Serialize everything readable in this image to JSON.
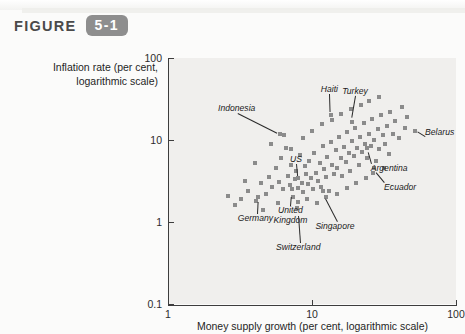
{
  "header": {
    "figure_word": "FIGURE",
    "figure_number": "5-1"
  },
  "chart_data": {
    "type": "scatter",
    "title": "",
    "xlabel": "Money supply growth (per cent, logarithmic scale)",
    "ylabel": "Inflation rate (per cent, logarithmic scale)",
    "ylabel_line1": "Inflation rate (per cent,",
    "ylabel_line2": "logarithmic scale)",
    "xscale": "log",
    "yscale": "log",
    "xlim": [
      1,
      100
    ],
    "ylim": [
      0.1,
      100
    ],
    "xticks": [
      "1",
      "10",
      "100"
    ],
    "yticks": [
      "100",
      "10",
      "1",
      "0.1"
    ],
    "grid": false,
    "legend": "none",
    "marker": "square",
    "marker_color": "#8b8b8b",
    "annotations": [
      {
        "label": "Indonesia",
        "x": 6.0,
        "y": 12.0
      },
      {
        "label": "Haiti",
        "x": 13.5,
        "y": 20.0
      },
      {
        "label": "Turkey",
        "x": 19.0,
        "y": 17.0
      },
      {
        "label": "Belarus",
        "x": 52.0,
        "y": 13.0
      },
      {
        "label": "Argentina",
        "x": 24.0,
        "y": 7.6
      },
      {
        "label": "Ecuador",
        "x": 27.0,
        "y": 4.2
      },
      {
        "label": "US",
        "x": 8.0,
        "y": 3.3
      },
      {
        "label": "United Kingdom",
        "x": 7.2,
        "y": 2.2
      },
      {
        "label": "Singapore",
        "x": 12.0,
        "y": 2.1
      },
      {
        "label": "Germany",
        "x": 4.2,
        "y": 1.9
      },
      {
        "label": "Switzerland",
        "x": 8.0,
        "y": 1.3
      }
    ],
    "points": [
      {
        "x": 3.2,
        "y": 1.9
      },
      {
        "x": 3.6,
        "y": 2.4
      },
      {
        "x": 4.1,
        "y": 1.8
      },
      {
        "x": 4.4,
        "y": 3.0
      },
      {
        "x": 4.8,
        "y": 2.2
      },
      {
        "x": 5.0,
        "y": 3.5
      },
      {
        "x": 5.3,
        "y": 2.7
      },
      {
        "x": 5.6,
        "y": 4.5
      },
      {
        "x": 5.9,
        "y": 3.1
      },
      {
        "x": 6.1,
        "y": 6.0
      },
      {
        "x": 6.3,
        "y": 2.5
      },
      {
        "x": 6.6,
        "y": 8.0
      },
      {
        "x": 6.8,
        "y": 3.6
      },
      {
        "x": 7.0,
        "y": 2.8
      },
      {
        "x": 7.2,
        "y": 5.0
      },
      {
        "x": 7.4,
        "y": 2.0
      },
      {
        "x": 7.6,
        "y": 3.3
      },
      {
        "x": 7.8,
        "y": 4.2
      },
      {
        "x": 8.0,
        "y": 2.6
      },
      {
        "x": 8.2,
        "y": 6.5
      },
      {
        "x": 8.5,
        "y": 3.0
      },
      {
        "x": 8.7,
        "y": 2.3
      },
      {
        "x": 8.9,
        "y": 4.8
      },
      {
        "x": 9.1,
        "y": 3.8
      },
      {
        "x": 9.4,
        "y": 2.9
      },
      {
        "x": 9.6,
        "y": 5.5
      },
      {
        "x": 9.9,
        "y": 3.4
      },
      {
        "x": 10.2,
        "y": 2.5
      },
      {
        "x": 10.4,
        "y": 7.0
      },
      {
        "x": 10.7,
        "y": 4.0
      },
      {
        "x": 11.0,
        "y": 3.2
      },
      {
        "x": 11.3,
        "y": 5.2
      },
      {
        "x": 11.6,
        "y": 2.7
      },
      {
        "x": 11.9,
        "y": 8.5
      },
      {
        "x": 12.2,
        "y": 4.4
      },
      {
        "x": 12.5,
        "y": 3.5
      },
      {
        "x": 12.8,
        "y": 6.2
      },
      {
        "x": 13.1,
        "y": 2.4
      },
      {
        "x": 13.5,
        "y": 9.5
      },
      {
        "x": 13.8,
        "y": 5.0
      },
      {
        "x": 14.2,
        "y": 3.8
      },
      {
        "x": 14.6,
        "y": 7.5
      },
      {
        "x": 15.0,
        "y": 4.6
      },
      {
        "x": 15.4,
        "y": 11.0
      },
      {
        "x": 15.8,
        "y": 6.0
      },
      {
        "x": 16.2,
        "y": 3.6
      },
      {
        "x": 16.7,
        "y": 8.2
      },
      {
        "x": 17.1,
        "y": 5.4
      },
      {
        "x": 17.6,
        "y": 12.5
      },
      {
        "x": 18.0,
        "y": 7.0
      },
      {
        "x": 18.5,
        "y": 4.2
      },
      {
        "x": 19.0,
        "y": 9.8
      },
      {
        "x": 19.5,
        "y": 6.4
      },
      {
        "x": 20.0,
        "y": 14.0
      },
      {
        "x": 20.6,
        "y": 8.0
      },
      {
        "x": 21.1,
        "y": 5.0
      },
      {
        "x": 21.7,
        "y": 11.0
      },
      {
        "x": 22.3,
        "y": 7.2
      },
      {
        "x": 22.9,
        "y": 16.0
      },
      {
        "x": 23.5,
        "y": 9.0
      },
      {
        "x": 24.2,
        "y": 6.0
      },
      {
        "x": 24.8,
        "y": 12.0
      },
      {
        "x": 25.5,
        "y": 8.4
      },
      {
        "x": 26.2,
        "y": 18.0
      },
      {
        "x": 27.0,
        "y": 10.0
      },
      {
        "x": 27.8,
        "y": 5.5
      },
      {
        "x": 28.6,
        "y": 13.5
      },
      {
        "x": 29.4,
        "y": 7.8
      },
      {
        "x": 30.2,
        "y": 20.0
      },
      {
        "x": 31.0,
        "y": 11.5
      },
      {
        "x": 32.0,
        "y": 9.0
      },
      {
        "x": 33.0,
        "y": 15.0
      },
      {
        "x": 34.0,
        "y": 6.8
      },
      {
        "x": 35.0,
        "y": 22.0
      },
      {
        "x": 36.5,
        "y": 12.0
      },
      {
        "x": 38.0,
        "y": 17.0
      },
      {
        "x": 40.0,
        "y": 10.5
      },
      {
        "x": 42.0,
        "y": 25.0
      },
      {
        "x": 44.0,
        "y": 14.0
      },
      {
        "x": 46.0,
        "y": 19.0
      },
      {
        "x": 2.6,
        "y": 2.1
      },
      {
        "x": 2.9,
        "y": 1.6
      },
      {
        "x": 3.4,
        "y": 3.2
      },
      {
        "x": 4.0,
        "y": 5.2
      },
      {
        "x": 4.6,
        "y": 1.4
      },
      {
        "x": 5.2,
        "y": 9.0
      },
      {
        "x": 5.8,
        "y": 1.7
      },
      {
        "x": 6.4,
        "y": 11.5
      },
      {
        "x": 7.1,
        "y": 7.8
      },
      {
        "x": 7.9,
        "y": 1.5
      },
      {
        "x": 8.6,
        "y": 10.5
      },
      {
        "x": 9.2,
        "y": 1.9
      },
      {
        "x": 10.0,
        "y": 13.0
      },
      {
        "x": 10.9,
        "y": 1.7
      },
      {
        "x": 11.8,
        "y": 15.5
      },
      {
        "x": 12.6,
        "y": 2.0
      },
      {
        "x": 13.7,
        "y": 17.5
      },
      {
        "x": 14.9,
        "y": 2.2
      },
      {
        "x": 16.0,
        "y": 21.0
      },
      {
        "x": 17.4,
        "y": 2.6
      },
      {
        "x": 18.8,
        "y": 24.0
      },
      {
        "x": 20.3,
        "y": 3.0
      },
      {
        "x": 21.9,
        "y": 27.0
      },
      {
        "x": 23.7,
        "y": 3.4
      },
      {
        "x": 25.0,
        "y": 30.0
      },
      {
        "x": 26.5,
        "y": 4.0
      },
      {
        "x": 29.0,
        "y": 33.0
      },
      {
        "x": 31.5,
        "y": 4.6
      },
      {
        "x": 52.0,
        "y": 13.0
      },
      {
        "x": 6.0,
        "y": 12.0
      },
      {
        "x": 13.5,
        "y": 20.0
      },
      {
        "x": 19.0,
        "y": 16.5
      },
      {
        "x": 24.0,
        "y": 8.0
      },
      {
        "x": 27.0,
        "y": 4.5
      },
      {
        "x": 8.0,
        "y": 3.4
      },
      {
        "x": 7.3,
        "y": 2.5
      },
      {
        "x": 12.0,
        "y": 2.4
      },
      {
        "x": 4.2,
        "y": 2.0
      },
      {
        "x": 8.0,
        "y": 1.75
      }
    ]
  }
}
